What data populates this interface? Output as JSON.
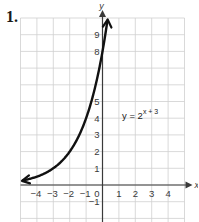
{
  "problem": {
    "number": "1."
  },
  "chart_data": {
    "type": "line",
    "title": "",
    "equation_label": {
      "base": "y = 2",
      "exponent": "x + 3"
    },
    "xlabel": "x",
    "ylabel": "y",
    "xlim": [
      -5,
      5
    ],
    "ylim": [
      -2,
      10
    ],
    "grid": true,
    "x_tick_labels": [
      "−4",
      "−3",
      "−2",
      "−1",
      "0",
      "1",
      "2",
      "3",
      "4"
    ],
    "x_tick_values": [
      -4,
      -3,
      -2,
      -1,
      0,
      1,
      2,
      3,
      4
    ],
    "y_tick_labels": [
      "−1",
      "1",
      "2",
      "3",
      "4",
      "5",
      "8",
      "9"
    ],
    "y_tick_values": [
      -1,
      1,
      2,
      3,
      4,
      5,
      8,
      9
    ],
    "series": [
      {
        "name": "y = 2^(x+3)",
        "x": [
          -5,
          -4,
          -3,
          -2,
          -1,
          0,
          0.2,
          0.32
        ],
        "y": [
          0.25,
          0.5,
          1,
          2,
          4,
          8,
          9.19,
          9.98
        ],
        "arrows": "both"
      }
    ]
  }
}
